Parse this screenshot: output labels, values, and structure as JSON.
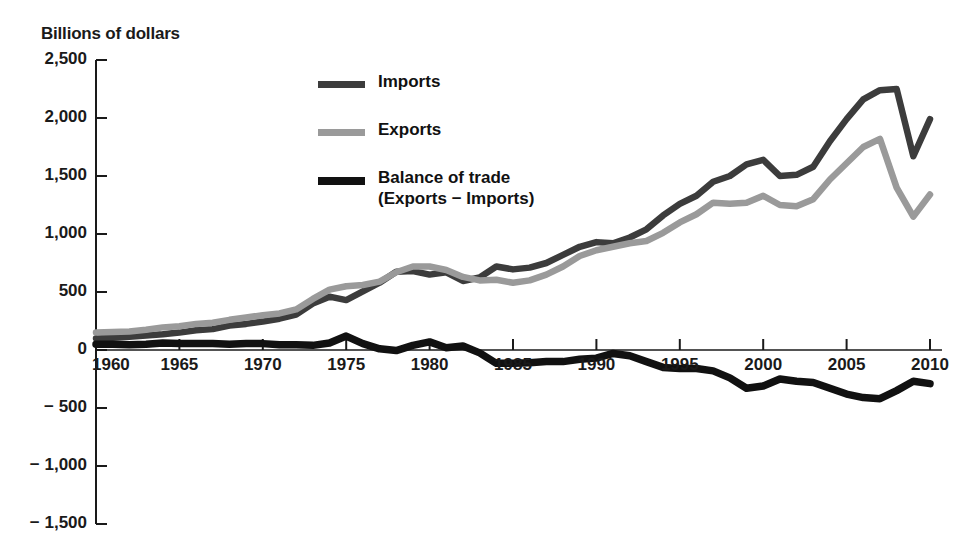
{
  "chart": {
    "title": "Billions of dollars"
  },
  "legend": {
    "items": [
      {
        "label": "Imports",
        "sublabel": "",
        "color": "#3c3c3c",
        "swatch_name": "legend-swatch-imports"
      },
      {
        "label": "Exports",
        "sublabel": "",
        "color": "#9a9a9a",
        "swatch_name": "legend-swatch-exports"
      },
      {
        "label": "Balance of trade",
        "sublabel": "(Exports − Imports)",
        "color": "#111111",
        "swatch_name": "legend-swatch-balance"
      }
    ]
  },
  "axes": {
    "y_ticks": [
      "2,500",
      "2,000",
      "1,500",
      "1,000",
      "500",
      "0",
      "− 500",
      "− 1,000",
      "− 1,500"
    ],
    "x_ticks": [
      "1960",
      "1965",
      "1970",
      "1975",
      "1980",
      "1985",
      "1990",
      "1995",
      "2000",
      "2005",
      "2010"
    ]
  },
  "chart_data": {
    "type": "line",
    "title": "Billions of dollars",
    "xlabel": "",
    "ylabel": "Billions of dollars",
    "xlim": [
      1960,
      2010
    ],
    "ylim": [
      -1500,
      2500
    ],
    "ytick_values": [
      2500,
      2000,
      1500,
      1000,
      500,
      0,
      -500,
      -1000,
      -1500
    ],
    "xtick_values": [
      1960,
      1965,
      1970,
      1975,
      1980,
      1985,
      1990,
      1995,
      2000,
      2005,
      2010
    ],
    "grid": false,
    "legend_position": "top-center",
    "x": [
      1960,
      1961,
      1962,
      1963,
      1964,
      1965,
      1966,
      1967,
      1968,
      1969,
      1970,
      1971,
      1972,
      1973,
      1974,
      1975,
      1976,
      1977,
      1978,
      1979,
      1980,
      1981,
      1982,
      1983,
      1984,
      1985,
      1986,
      1987,
      1988,
      1989,
      1990,
      1991,
      1992,
      1993,
      1994,
      1995,
      1996,
      1997,
      1998,
      1999,
      2000,
      2001,
      2002,
      2003,
      2004,
      2005,
      2006,
      2007,
      2008,
      2009,
      2010
    ],
    "series": [
      {
        "name": "Imports",
        "color": "#3c3c3c",
        "values": [
          100,
          105,
          115,
          125,
          135,
          150,
          170,
          180,
          210,
          225,
          245,
          270,
          305,
          400,
          460,
          430,
          505,
          580,
          675,
          680,
          650,
          670,
          595,
          625,
          720,
          695,
          710,
          750,
          820,
          890,
          930,
          920,
          970,
          1040,
          1160,
          1260,
          1330,
          1450,
          1500,
          1600,
          1640,
          1500,
          1510,
          1580,
          1800,
          1990,
          2160,
          2240,
          2250,
          1670,
          1990
        ]
      },
      {
        "name": "Exports",
        "color": "#9a9a9a",
        "values": [
          150,
          155,
          160,
          175,
          195,
          205,
          225,
          235,
          260,
          280,
          300,
          315,
          350,
          440,
          520,
          550,
          560,
          590,
          670,
          720,
          720,
          690,
          630,
          600,
          605,
          580,
          600,
          650,
          720,
          810,
          860,
          890,
          920,
          940,
          1010,
          1100,
          1170,
          1270,
          1260,
          1270,
          1330,
          1250,
          1240,
          1300,
          1470,
          1610,
          1750,
          1820,
          1400,
          1150,
          1340
        ]
      },
      {
        "name": "Balance of trade",
        "color": "#111111",
        "values": [
          50,
          50,
          45,
          50,
          60,
          55,
          55,
          55,
          50,
          55,
          55,
          45,
          45,
          40,
          60,
          120,
          55,
          10,
          -5,
          40,
          70,
          20,
          35,
          -25,
          -115,
          -115,
          -110,
          -100,
          -100,
          -80,
          -70,
          -30,
          -50,
          -100,
          -150,
          -160,
          -160,
          -180,
          -240,
          -330,
          -310,
          -250,
          -270,
          -280,
          -330,
          -380,
          -410,
          -420,
          -350,
          -270,
          -290
        ]
      }
    ]
  }
}
